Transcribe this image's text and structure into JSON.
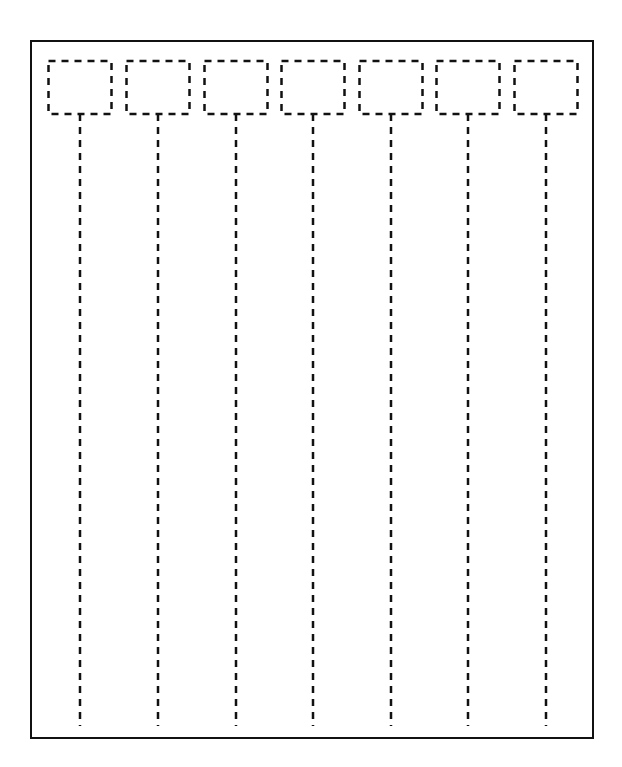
{
  "diagram": {
    "type": "sequence-diagram-template",
    "frame": {
      "x": 31,
      "y": 41,
      "width": 562,
      "height": 697,
      "stroke": "#111111",
      "stroke_width": 2
    },
    "participant_box": {
      "y": 61,
      "width": 63,
      "height": 53,
      "stroke": "#111111",
      "dash": "7,6"
    },
    "lifeline": {
      "y_start": 114,
      "y_end": 726,
      "stroke": "#111111",
      "dash": "7,6"
    },
    "participants": [
      {
        "label": "",
        "center_x": 80
      },
      {
        "label": "",
        "center_x": 158
      },
      {
        "label": "",
        "center_x": 236
      },
      {
        "label": "",
        "center_x": 313
      },
      {
        "label": "",
        "center_x": 391
      },
      {
        "label": "",
        "center_x": 468
      },
      {
        "label": "",
        "center_x": 546
      }
    ]
  }
}
